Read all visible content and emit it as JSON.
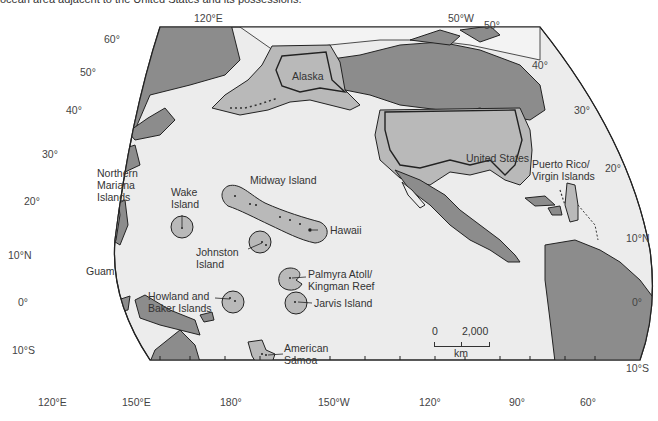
{
  "caption": "ocean area adjacent to the United States and its possessions.",
  "colors": {
    "ocean": "#ececec",
    "foreign_land": "#8c8c8c",
    "us_territory": "#b9b9b9",
    "ice_light": "#f3f3f3",
    "outline": "#222222"
  },
  "graticule": {
    "top_labels": [
      "120°E",
      "50°W"
    ],
    "left_lat": [
      "60°",
      "50°",
      "40°",
      "30°",
      "20°",
      "10°N",
      "0°",
      "10°S"
    ],
    "right_lat": [
      "50°",
      "40°",
      "30°",
      "20°",
      "10°N",
      "0°",
      "10°S"
    ],
    "bottom_lon": [
      "120°E",
      "150°E",
      "180°",
      "150°W",
      "120°",
      "90°",
      "60°"
    ]
  },
  "regions": {
    "alaska": "Alaska",
    "united_states": "United States",
    "puerto_rico": "Puerto Rico/\nVirgin Islands",
    "northern_mariana": "Northern\nMariana\nIslands",
    "guam": "Guam",
    "wake": "Wake\nIsland",
    "midway": "Midway Island",
    "hawaii": "Hawaii",
    "johnston": "Johnston\nIsland",
    "palmyra": "Palmyra Atoll/\nKingman Reef",
    "howland_baker": "Howland and\nBaker Islands",
    "jarvis": "Jarvis Island",
    "american_samoa": "American\nSamoa"
  },
  "scale_bar": {
    "start": "0",
    "end": "2,000",
    "unit": "km"
  }
}
